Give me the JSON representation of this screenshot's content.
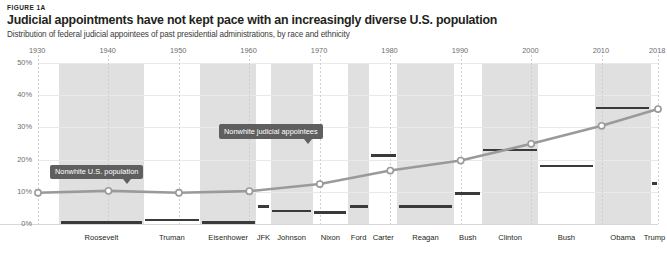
{
  "header": {
    "figure_label": "FIGURE 1A",
    "title": "Judicial appointments have not kept pace with an increasingly diverse U.S. population",
    "subtitle": "Distribution of federal judicial appointees of past presidential administrations, by race and ethnicity"
  },
  "callouts": [
    {
      "id": "population",
      "text": "Nonwhite U.S. population"
    },
    {
      "id": "appointees",
      "text": "Nonwhite judicial appointees"
    }
  ],
  "chart_data": {
    "type": "line",
    "title": "Judicial appointments have not kept pace with an increasingly diverse U.S. population",
    "subtitle": "Distribution of federal judicial appointees of past presidential administrations, by race and ethnicity",
    "xlabel": "",
    "ylabel": "",
    "xlim": [
      1930,
      2018
    ],
    "ylim": [
      0,
      50
    ],
    "grid": true,
    "legend_position": "inline-callouts",
    "x_ticks": [
      "1930",
      "1940",
      "1950",
      "1960",
      "1970",
      "1980",
      "1990",
      "2000",
      "2010",
      "2018"
    ],
    "x_tick_values": [
      1930,
      1940,
      1950,
      1960,
      1970,
      1980,
      1990,
      2000,
      2010,
      2018
    ],
    "y_ticks": [
      "0%",
      "10%",
      "20%",
      "30%",
      "40%",
      "50%"
    ],
    "y_tick_values": [
      0,
      10,
      20,
      30,
      40,
      50
    ],
    "series": [
      {
        "name": "Nonwhite U.S. population",
        "type": "line",
        "color": "#9a9a9a",
        "marker": "open-circle",
        "x": [
          1930,
          1940,
          1950,
          1960,
          1970,
          1980,
          1990,
          2000,
          2010,
          2018
        ],
        "values": [
          9.7,
          10.3,
          9.7,
          10.2,
          12.4,
          16.6,
          19.7,
          24.9,
          30.5,
          35.7
        ]
      },
      {
        "name": "Nonwhite judicial appointees",
        "type": "bar-marker",
        "color": "#3a3a3a",
        "categories": [
          "Roosevelt",
          "Truman",
          "Eisenhower",
          "JFK",
          "Johnson",
          "Nixon",
          "Ford",
          "Carter",
          "Reagan",
          "Bush",
          "Clinton",
          "Bush",
          "Obama",
          "Trump"
        ],
        "values": [
          0.4,
          1.2,
          0.5,
          5.5,
          4.0,
          3.5,
          5.5,
          21.3,
          5.5,
          9.5,
          23.0,
          18.0,
          36.0,
          12.5
        ]
      }
    ],
    "presidents": [
      {
        "name": "Roosevelt",
        "start": 1933,
        "end": 1945,
        "nonwhite_appointees_pct": 0.4
      },
      {
        "name": "Truman",
        "start": 1945,
        "end": 1953,
        "nonwhite_appointees_pct": 1.2
      },
      {
        "name": "Eisenhower",
        "start": 1953,
        "end": 1961,
        "nonwhite_appointees_pct": 0.5
      },
      {
        "name": "JFK",
        "start": 1961,
        "end": 1963,
        "nonwhite_appointees_pct": 5.5
      },
      {
        "name": "Johnson",
        "start": 1963,
        "end": 1969,
        "nonwhite_appointees_pct": 4.0
      },
      {
        "name": "Nixon",
        "start": 1969,
        "end": 1974,
        "nonwhite_appointees_pct": 3.5
      },
      {
        "name": "Ford",
        "start": 1974,
        "end": 1977,
        "nonwhite_appointees_pct": 5.5
      },
      {
        "name": "Carter",
        "start": 1977,
        "end": 1981,
        "nonwhite_appointees_pct": 21.3
      },
      {
        "name": "Reagan",
        "start": 1981,
        "end": 1989,
        "nonwhite_appointees_pct": 5.5
      },
      {
        "name": "Bush",
        "start": 1989,
        "end": 1993,
        "nonwhite_appointees_pct": 9.5
      },
      {
        "name": "Clinton",
        "start": 1993,
        "end": 2001,
        "nonwhite_appointees_pct": 23.0
      },
      {
        "name": "Bush",
        "start": 2001,
        "end": 2009,
        "nonwhite_appointees_pct": 18.0
      },
      {
        "name": "Obama",
        "start": 2009,
        "end": 2017,
        "nonwhite_appointees_pct": 36.0
      },
      {
        "name": "Trump",
        "start": 2017,
        "end": 2018,
        "nonwhite_appointees_pct": 12.5
      }
    ]
  },
  "colors": {
    "line": "#9a9a9a",
    "bar": "#3a3a3a",
    "band": "#e0e0e0",
    "callout_bg": "#5f5f5f",
    "text": "#231f20",
    "axis_text": "#6d6d6d"
  }
}
